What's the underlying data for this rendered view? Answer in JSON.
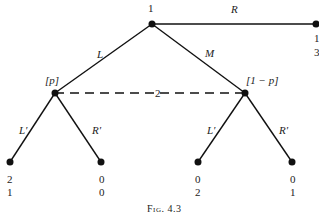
{
  "figure": {
    "caption": "Fig. 4.3",
    "root": {
      "player": "1"
    },
    "moves_player1": [
      "L",
      "M",
      "R"
    ],
    "outside_payoff": {
      "p1": "1",
      "p2": "3"
    },
    "info_set": {
      "player": "2",
      "left_belief": "[p]",
      "right_belief": "[1 − p]"
    },
    "moves_player2_left": [
      "L′",
      "R′"
    ],
    "moves_player2_right": [
      "L′",
      "R′"
    ],
    "leaves": [
      {
        "p1": "2",
        "p2": "1"
      },
      {
        "p1": "0",
        "p2": "0"
      },
      {
        "p1": "0",
        "p2": "2"
      },
      {
        "p1": "0",
        "p2": "1"
      }
    ]
  }
}
